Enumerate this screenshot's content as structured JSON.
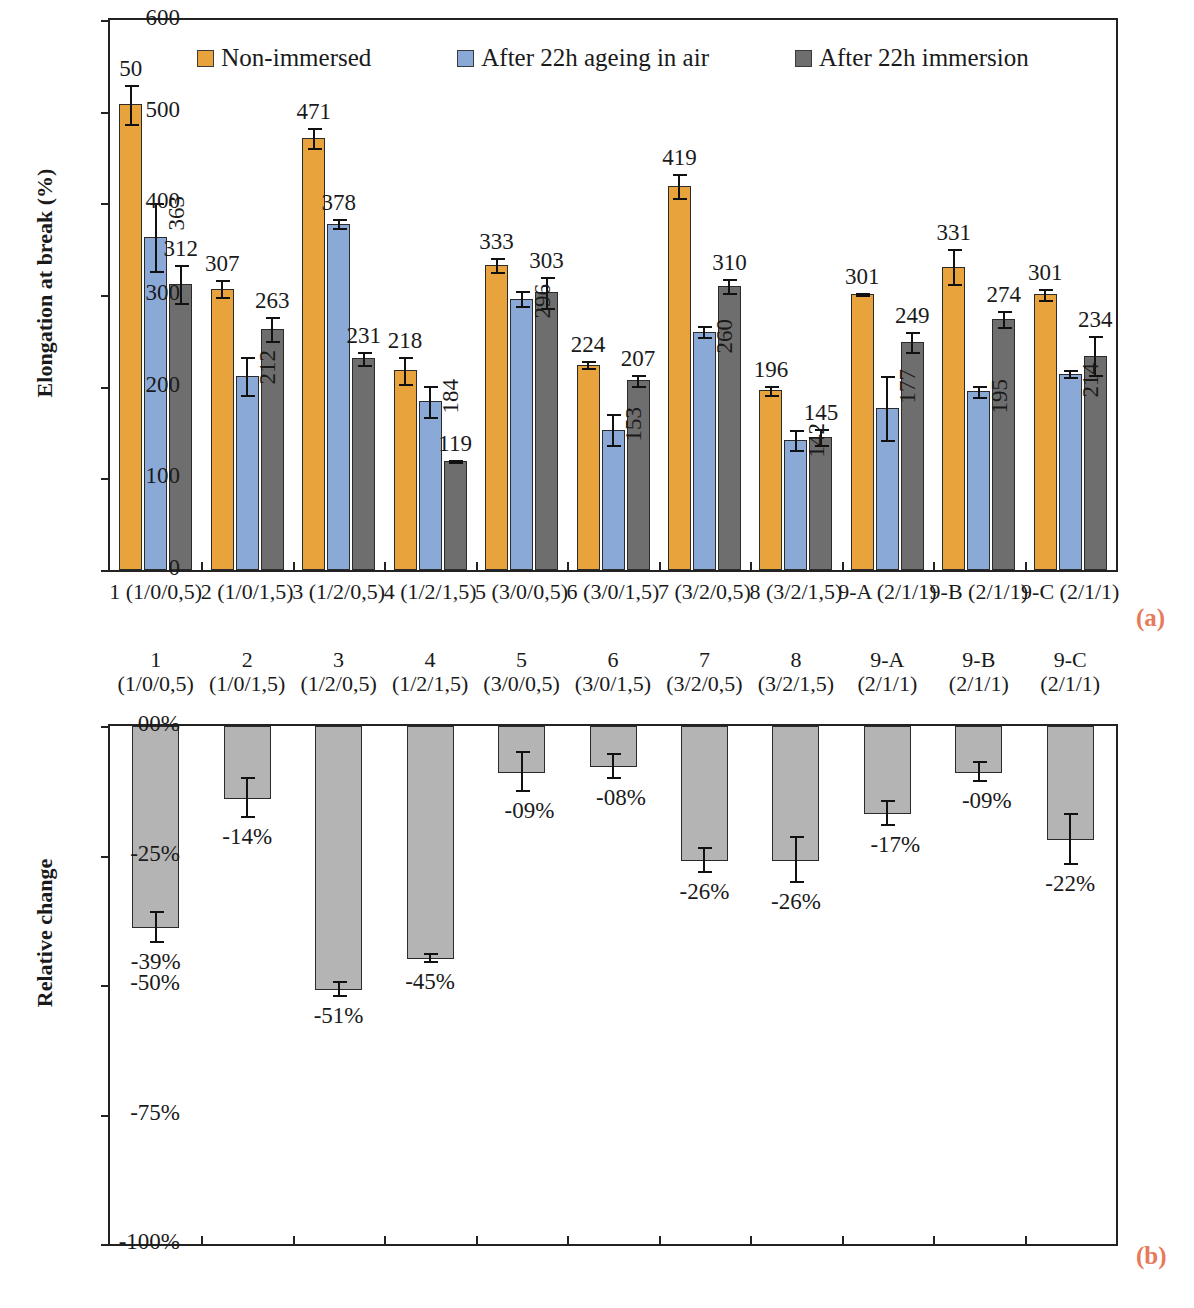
{
  "figure": {
    "panel_a_marker": "(a)",
    "panel_b_marker": "(b)",
    "marker_color": "#e8795a"
  },
  "chart_data": [
    {
      "type": "bar",
      "panel": "(a)",
      "title": "",
      "xlabel": "",
      "ylabel": "Elongation at break (%)",
      "ylim": [
        0,
        600
      ],
      "yticks": [
        "0",
        "100",
        "200",
        "300",
        "400",
        "500",
        "600"
      ],
      "grid": false,
      "legend_position": "top-center",
      "categories": [
        "1 (1/0/0,5)",
        "2 (1/0/1,5)",
        "3 (1/2/0,5)",
        "4 (1/2/1,5)",
        "5 (3/0/0,5)",
        "6 (3/0/1,5)",
        "7 (3/2/0,5)",
        "8 (3/2/1,5)",
        "9-A (2/1/1)",
        "9-B (2/1/1)",
        "9-C (2/1/1)"
      ],
      "series": [
        {
          "name": "Non-immersed",
          "color": "#e8a33d",
          "values": [
            508,
            307,
            471,
            218,
            333,
            224,
            419,
            196,
            301,
            331,
            301
          ],
          "labels": [
            "50",
            "307",
            "471",
            "218",
            "333",
            "224",
            "419",
            "196",
            "301",
            "331",
            "301"
          ],
          "errors": [
            22,
            10,
            12,
            16,
            9,
            5,
            14,
            6,
            2,
            20,
            7
          ]
        },
        {
          "name": "After 22h ageing in air",
          "color": "#8aa9d6",
          "values": [
            363,
            212,
            378,
            184,
            296,
            153,
            260,
            142,
            177,
            195,
            214
          ],
          "labels": [
            "363",
            "212",
            "378",
            "184",
            "296",
            "153",
            "260",
            "142",
            "177",
            "195",
            "214"
          ],
          "errors": [
            38,
            22,
            6,
            18,
            9,
            18,
            7,
            12,
            36,
            7,
            5
          ]
        },
        {
          "name": "After 22h immersion",
          "color": "#6e6e6e",
          "values": [
            312,
            263,
            231,
            119,
            303,
            207,
            310,
            145,
            249,
            274,
            234
          ],
          "labels": [
            "312",
            "263",
            "231",
            "119",
            "303",
            "207",
            "310",
            "145",
            "249",
            "274",
            "234"
          ],
          "errors": [
            22,
            14,
            8,
            2,
            18,
            7,
            9,
            10,
            12,
            10,
            22
          ]
        }
      ]
    },
    {
      "type": "bar",
      "panel": "(b)",
      "title": "",
      "xlabel": "",
      "ylabel": "Relative change",
      "ylim": [
        -100,
        0
      ],
      "yticks": [
        "00%",
        "-25%",
        "-50%",
        "-75%",
        "-100%"
      ],
      "grid": false,
      "legend_position": "none",
      "categories": [
        "1\n(1/0/0,5)",
        "2\n(1/0/1,5)",
        "3\n(1/2/0,5)",
        "4\n(1/2/1,5)",
        "5\n(3/0/0,5)",
        "6\n(3/0/1,5)",
        "7\n(3/2/0,5)",
        "8\n(3/2/1,5)",
        "9-A\n(2/1/1)",
        "9-B\n(2/1/1)",
        "9-C\n(2/1/1)"
      ],
      "category_lines": [
        [
          "1",
          "(1/0/0,5)"
        ],
        [
          "2",
          "(1/0/1,5)"
        ],
        [
          "3",
          "(1/2/0,5)"
        ],
        [
          "4",
          "(1/2/1,5)"
        ],
        [
          "5",
          "(3/0/0,5)"
        ],
        [
          "6",
          "(3/0/1,5)"
        ],
        [
          "7",
          "(3/2/0,5)"
        ],
        [
          "8",
          "(3/2/1,5)"
        ],
        [
          "9-A",
          "(2/1/1)"
        ],
        [
          "9-B",
          "(2/1/1)"
        ],
        [
          "9-C",
          "(2/1/1)"
        ]
      ],
      "series": [
        {
          "name": "Relative change",
          "color": "#b4b4b4",
          "values": [
            -39,
            -14,
            -51,
            -45,
            -9,
            -8,
            -26,
            -26,
            -17,
            -9,
            -22
          ],
          "labels": [
            "-39%",
            "-14%",
            "-51%",
            "-45%",
            "-09%",
            "-08%",
            "-26%",
            "-26%",
            "-17%",
            "-09%",
            "-22%"
          ],
          "errors": [
            3,
            4,
            1.5,
            1,
            4,
            2.5,
            2.5,
            4.5,
            2.5,
            2,
            5
          ]
        }
      ]
    }
  ]
}
